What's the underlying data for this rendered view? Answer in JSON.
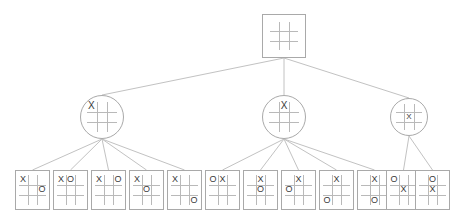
{
  "diagram": {
    "colors": {
      "edge": "#c2c2c2",
      "grid": "#b9b9b9",
      "border": "#a9a9a9",
      "mark": "#3a3a3a",
      "background": "#ffffff"
    },
    "marks": {
      "x": "X",
      "o": "O",
      "empty": ""
    }
  },
  "nodes": [
    {
      "id": "root",
      "name": "root-empty-board",
      "shape": "square",
      "x": 262,
      "y": 14,
      "w": 44,
      "h": 44,
      "cells": [
        "",
        "",
        "",
        "",
        "",
        "",
        "",
        "",
        ""
      ]
    },
    {
      "id": "m1",
      "name": "level1-x-top-left",
      "shape": "circle",
      "x": 80,
      "y": 95,
      "w": 44,
      "h": 44,
      "cells": [
        "X",
        "",
        "",
        "",
        "",
        "",
        "",
        "",
        ""
      ]
    },
    {
      "id": "m2",
      "name": "level1-x-top-middle",
      "shape": "circle",
      "x": 262,
      "y": 95,
      "w": 44,
      "h": 44,
      "cells": [
        "",
        "X",
        "",
        "",
        "",
        "",
        "",
        "",
        ""
      ]
    },
    {
      "id": "m3",
      "name": "level1-x-center",
      "shape": "circle",
      "x": 390,
      "y": 98,
      "w": 38,
      "h": 38,
      "cells": [
        "",
        "",
        "",
        "",
        "X",
        "",
        "",
        "",
        ""
      ]
    },
    {
      "id": "l1",
      "name": "leaf-x-topleft-o-midright",
      "shape": "rect",
      "x": 15,
      "y": 170,
      "w": 35,
      "h": 40,
      "cells": [
        "X",
        "",
        "",
        "",
        "",
        "O",
        "",
        "",
        ""
      ]
    },
    {
      "id": "l2",
      "name": "leaf-x-topleft-o-topmiddle",
      "shape": "rect",
      "x": 53,
      "y": 170,
      "w": 35,
      "h": 40,
      "cells": [
        "X",
        "O",
        "",
        "",
        "",
        "",
        "",
        "",
        ""
      ]
    },
    {
      "id": "l3",
      "name": "leaf-x-topleft-o-topright",
      "shape": "rect",
      "x": 91,
      "y": 170,
      "w": 35,
      "h": 40,
      "cells": [
        "X",
        "",
        "O",
        "",
        "",
        "",
        "",
        "",
        ""
      ]
    },
    {
      "id": "l4",
      "name": "leaf-x-topleft-o-center",
      "shape": "rect",
      "x": 129,
      "y": 170,
      "w": 35,
      "h": 40,
      "cells": [
        "X",
        "",
        "",
        "",
        "O",
        "",
        "",
        "",
        ""
      ]
    },
    {
      "id": "l5",
      "name": "leaf-x-topleft-o-bottomright",
      "shape": "rect",
      "x": 167,
      "y": 170,
      "w": 35,
      "h": 40,
      "cells": [
        "X",
        "",
        "",
        "",
        "",
        "",
        "",
        "",
        "O"
      ]
    },
    {
      "id": "l6",
      "name": "leaf-o-topleft-x-topmiddle",
      "shape": "rect",
      "x": 205,
      "y": 170,
      "w": 35,
      "h": 40,
      "cells": [
        "O",
        "X",
        "",
        "",
        "",
        "",
        "",
        "",
        ""
      ]
    },
    {
      "id": "l7",
      "name": "leaf-x-topmiddle-o-center",
      "shape": "rect",
      "x": 243,
      "y": 170,
      "w": 35,
      "h": 40,
      "cells": [
        "",
        "X",
        "",
        "",
        "O",
        "",
        "",
        "",
        ""
      ]
    },
    {
      "id": "l8",
      "name": "leaf-x-topmiddle-o-midleft",
      "shape": "rect",
      "x": 281,
      "y": 170,
      "w": 35,
      "h": 40,
      "cells": [
        "",
        "X",
        "",
        "O",
        "",
        "",
        "",
        "",
        ""
      ]
    },
    {
      "id": "l9",
      "name": "leaf-x-topmiddle-o-bottomleft",
      "shape": "rect",
      "x": 319,
      "y": 170,
      "w": 35,
      "h": 40,
      "cells": [
        "",
        "X",
        "",
        "",
        "",
        "",
        "O",
        "",
        ""
      ]
    },
    {
      "id": "l10",
      "name": "leaf-x-topmiddle-o-bottommiddle",
      "shape": "rect",
      "x": 357,
      "y": 170,
      "w": 35,
      "h": 40,
      "cells": [
        "",
        "X",
        "",
        "",
        "",
        "",
        "",
        "O",
        ""
      ]
    },
    {
      "id": "l11",
      "name": "leaf-o-topleft-x-center",
      "shape": "rect",
      "x": 386,
      "y": 170,
      "w": 35,
      "h": 40,
      "cells": [
        "O",
        "",
        "",
        "",
        "X",
        "",
        "",
        "",
        ""
      ]
    },
    {
      "id": "l12",
      "name": "leaf-o-topmiddle-x-center",
      "shape": "rect",
      "x": 415,
      "y": 170,
      "w": 35,
      "h": 40,
      "cells": [
        "",
        "O",
        "",
        "",
        "X",
        "",
        "",
        "",
        ""
      ]
    }
  ],
  "edges": [
    {
      "name": "edge-root-to-level1-x-top-left",
      "from": "root",
      "to": "m1"
    },
    {
      "name": "edge-root-to-level1-x-top-middle",
      "from": "root",
      "to": "m2"
    },
    {
      "name": "edge-root-to-level1-x-center",
      "from": "root",
      "to": "m3"
    },
    {
      "name": "edge-m1-to-l1",
      "from": "m1",
      "to": "l1"
    },
    {
      "name": "edge-m1-to-l2",
      "from": "m1",
      "to": "l2"
    },
    {
      "name": "edge-m1-to-l3",
      "from": "m1",
      "to": "l3"
    },
    {
      "name": "edge-m1-to-l4",
      "from": "m1",
      "to": "l4"
    },
    {
      "name": "edge-m1-to-l5",
      "from": "m1",
      "to": "l5"
    },
    {
      "name": "edge-m2-to-l6",
      "from": "m2",
      "to": "l6"
    },
    {
      "name": "edge-m2-to-l7",
      "from": "m2",
      "to": "l7"
    },
    {
      "name": "edge-m2-to-l8",
      "from": "m2",
      "to": "l8"
    },
    {
      "name": "edge-m2-to-l9",
      "from": "m2",
      "to": "l9"
    },
    {
      "name": "edge-m2-to-l10",
      "from": "m2",
      "to": "l10"
    },
    {
      "name": "edge-m3-to-l11",
      "from": "m3",
      "to": "l11"
    },
    {
      "name": "edge-m3-to-l12",
      "from": "m3",
      "to": "l12"
    }
  ]
}
